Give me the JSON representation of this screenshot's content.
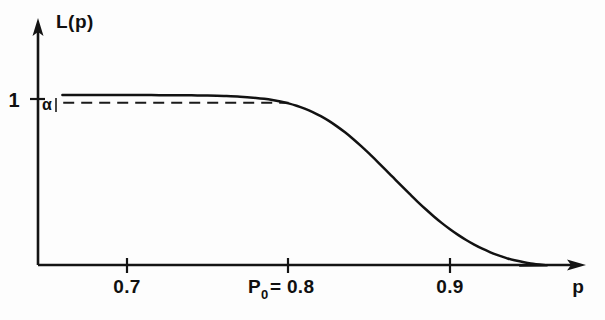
{
  "figure": {
    "name": "operating-characteristic-curve",
    "background_color": "#fdfdfd",
    "ink_color": "#121212"
  },
  "chart_data": {
    "type": "line",
    "title": "",
    "subtitle": "",
    "xlabel": "p",
    "ylabel": "L(p)",
    "grid": false,
    "legend": null,
    "xlim": [
      0.655,
      0.965
    ],
    "ylim": [
      0.0,
      1.12
    ],
    "x_ticks": [
      0.7,
      0.8,
      0.9
    ],
    "x_tick_labels": [
      "0.7",
      "P0 = 0.8",
      "0.9"
    ],
    "y_ticks": [
      1.0
    ],
    "y_tick_labels": [
      "1"
    ],
    "annotations": [
      {
        "name": "alpha-level",
        "label": "α",
        "y_value": 0.955,
        "x_start": 0.6605,
        "x_end": 0.8,
        "style": "dashed"
      },
      {
        "name": "p0-marker",
        "label": "P0 = 0.8",
        "x_value": 0.8
      }
    ],
    "series": [
      {
        "name": "L(p)",
        "style": "solid",
        "x": [
          0.66,
          0.67,
          0.68,
          0.69,
          0.7,
          0.71,
          0.72,
          0.73,
          0.74,
          0.75,
          0.76,
          0.77,
          0.78,
          0.785,
          0.79,
          0.795,
          0.8,
          0.805,
          0.81,
          0.815,
          0.82,
          0.825,
          0.83,
          0.835,
          0.84,
          0.845,
          0.85,
          0.855,
          0.86,
          0.865,
          0.87,
          0.875,
          0.88,
          0.885,
          0.89,
          0.895,
          0.9,
          0.905,
          0.91,
          0.915,
          0.92,
          0.925,
          0.93,
          0.935,
          0.94,
          0.95,
          0.96
        ],
        "y": [
          1.0,
          1.0,
          1.0,
          1.0,
          1.0,
          1.0,
          0.999,
          0.999,
          0.998,
          0.997,
          0.994,
          0.99,
          0.983,
          0.978,
          0.971,
          0.962,
          0.951,
          0.937,
          0.92,
          0.9,
          0.876,
          0.848,
          0.816,
          0.781,
          0.742,
          0.7,
          0.656,
          0.61,
          0.563,
          0.515,
          0.467,
          0.42,
          0.374,
          0.33,
          0.288,
          0.249,
          0.213,
          0.18,
          0.15,
          0.123,
          0.099,
          0.078,
          0.06,
          0.044,
          0.031,
          0.012,
          0.002
        ]
      }
    ]
  },
  "labels": {
    "y_axis": "L(p)",
    "x_axis": "p",
    "y_tick_one": "1",
    "alpha": "α",
    "x_tick_07": "0.7",
    "x_tick_p0_prefix": "P",
    "x_tick_p0_sub": "0",
    "x_tick_p0_suffix": "= 0.8",
    "x_tick_09": "0.9"
  },
  "caption": {
    "partial_text": ""
  }
}
